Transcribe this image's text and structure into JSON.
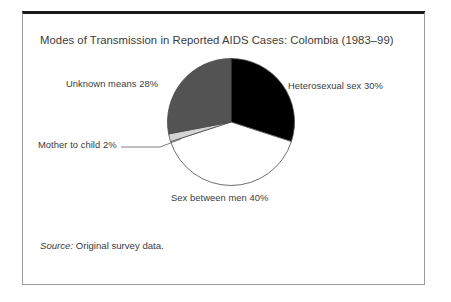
{
  "figure": {
    "title": "Modes of Transmission in Reported AIDS Cases: Colombia (1983–99)",
    "source_label": "Source:",
    "source_text": " Original survey data.",
    "frame_border_color": "#9b9b9b",
    "frame_top_rule_color": "#1a1a1a",
    "background_color": "#ffffff",
    "text_color": "#3b3b3b"
  },
  "chart_data": {
    "type": "pie",
    "title": "Modes of Transmission in Reported AIDS Cases: Colombia (1983–99)",
    "xlabel": "",
    "ylabel": "",
    "unit": "%",
    "legend_position": "none",
    "labels_position": "outside-with-leader",
    "grid": false,
    "start_angle_deg": 0,
    "direction": "clockwise",
    "categories": [
      "Heterosexual sex",
      "Sex between men",
      "Mother to child",
      "Unknown means"
    ],
    "values": [
      30,
      40,
      2,
      28
    ],
    "colors": [
      "#000000",
      "#ffffff",
      "#d4d4d4",
      "#535353"
    ],
    "slices": [
      {
        "name": "Heterosexual sex",
        "value": 30,
        "label": "Heterosexual sex 30%",
        "color": "#000000",
        "start_deg": 0,
        "end_deg": 108
      },
      {
        "name": "Sex between men",
        "value": 40,
        "label": "Sex between men 40%",
        "color": "#ffffff",
        "start_deg": 108,
        "end_deg": 252
      },
      {
        "name": "Mother to child",
        "value": 2,
        "label": "Mother to child 2%",
        "color": "#d4d4d4",
        "start_deg": 252,
        "end_deg": 259.2,
        "has_leader_line": true
      },
      {
        "name": "Unknown means",
        "value": 28,
        "label": "Unknown means 28%",
        "color": "#535353",
        "start_deg": 259.2,
        "end_deg": 360
      }
    ],
    "total": 100
  }
}
